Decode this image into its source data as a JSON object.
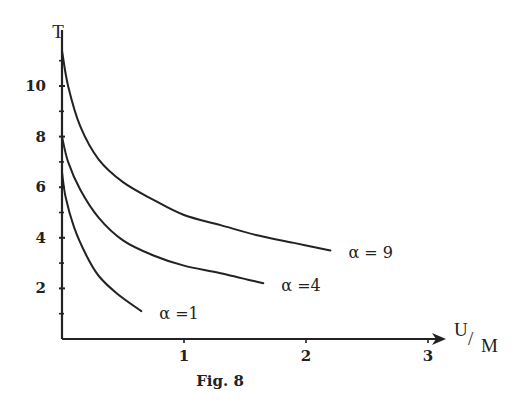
{
  "chart_data": {
    "type": "line",
    "title": "",
    "caption": "Fig. 8",
    "xlabel": "U/M",
    "xlabel_parts": {
      "num": "U",
      "slash": "/",
      "den": "M"
    },
    "ylabel": "T",
    "xlim": [
      0,
      3.1
    ],
    "ylim": [
      0,
      12
    ],
    "grid": false,
    "legend": "inline labels at curve ends",
    "x_ticks": [
      1,
      2,
      3
    ],
    "x_tick_labels": [
      "1",
      "2",
      "3"
    ],
    "y_ticks": [
      2,
      4,
      6,
      8,
      10
    ],
    "y_tick_labels": [
      "2",
      "4",
      "6",
      "8",
      "10"
    ],
    "y_minor_ticks": [
      1,
      3,
      5,
      7,
      9,
      11
    ],
    "series": [
      {
        "name": "α = 9",
        "label": "α = 9",
        "x": [
          0.0,
          0.05,
          0.15,
          0.3,
          0.5,
          0.75,
          1.0,
          1.3,
          1.6,
          1.9,
          2.2
        ],
        "y": [
          11.4,
          10.0,
          8.4,
          7.1,
          6.2,
          5.5,
          4.9,
          4.5,
          4.1,
          3.8,
          3.5
        ]
      },
      {
        "name": "α = 4",
        "label": "α =4",
        "x": [
          0.0,
          0.05,
          0.15,
          0.3,
          0.5,
          0.75,
          1.0,
          1.3,
          1.65
        ],
        "y": [
          8.0,
          7.0,
          5.9,
          4.8,
          3.9,
          3.3,
          2.9,
          2.6,
          2.2
        ]
      },
      {
        "name": "α = 1",
        "label": "α =1",
        "x": [
          0.0,
          0.03,
          0.1,
          0.2,
          0.3,
          0.45,
          0.65
        ],
        "y": [
          6.6,
          5.6,
          4.4,
          3.3,
          2.5,
          1.8,
          1.1
        ]
      }
    ]
  }
}
